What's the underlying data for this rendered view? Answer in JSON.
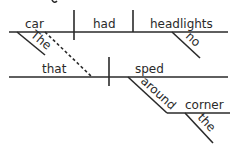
{
  "diagram": {
    "type": "sentence-diagram",
    "main_clause": {
      "subject": "car",
      "subject_modifier": "The",
      "verb": "had",
      "object": "headlights",
      "object_modifier": "no"
    },
    "relative_clause": {
      "subject": "that",
      "verb": "sped",
      "preposition": "around",
      "prep_object": "corner",
      "prep_object_modifier": "the"
    }
  },
  "colors": {
    "ink": "#2a2a2a",
    "background": "#ffffff"
  }
}
